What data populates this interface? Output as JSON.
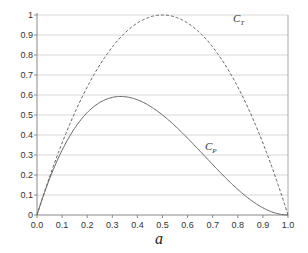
{
  "chart_data": {
    "type": "line",
    "title": "",
    "xlabel": "a",
    "ylabel": "",
    "xlim": [
      0,
      1
    ],
    "ylim": [
      0,
      1
    ],
    "grid": "horizontal",
    "legend": "inline labels",
    "x_ticks": [
      "0.0",
      "0.1",
      "0.2",
      "0.3",
      "0.4",
      "0.5",
      "0.6",
      "0.7",
      "0.8",
      "0.9",
      "1.0"
    ],
    "y_ticks": [
      "0",
      "0.1",
      "0.2",
      "0.3",
      "0.4",
      "0.5",
      "0.6",
      "0.7",
      "0.8",
      "0.9",
      "1"
    ],
    "x": [
      0.0,
      0.1,
      0.2,
      0.3,
      0.333,
      0.4,
      0.5,
      0.6,
      0.7,
      0.8,
      0.9,
      1.0
    ],
    "series": [
      {
        "name": "C_T",
        "label_main": "C",
        "label_sub": "T",
        "style": "dashed",
        "values": [
          0.0,
          0.36,
          0.64,
          0.84,
          0.889,
          0.96,
          1.0,
          0.96,
          0.84,
          0.64,
          0.36,
          0.0
        ]
      },
      {
        "name": "C_P",
        "label_main": "C",
        "label_sub": "P",
        "style": "solid",
        "values": [
          0.0,
          0.324,
          0.512,
          0.588,
          0.593,
          0.576,
          0.5,
          0.384,
          0.252,
          0.128,
          0.036,
          0.0
        ]
      }
    ]
  }
}
